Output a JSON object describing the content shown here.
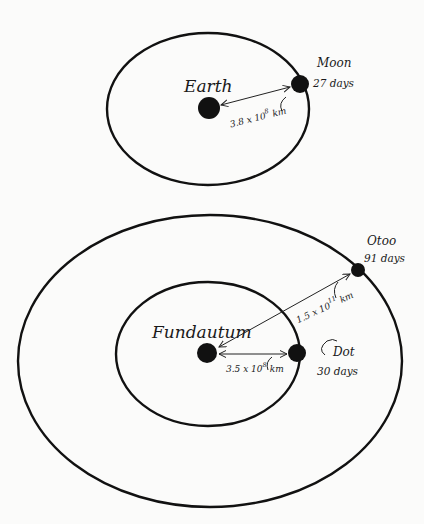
{
  "diagrams": [
    {
      "id": "earth-system",
      "central_body": {
        "name": "Earth"
      },
      "satellites": [
        {
          "name": "Moon",
          "period": "27 days",
          "distance": {
            "mantissa": "3.8 x 10",
            "exponent": "8",
            "unit": "km"
          }
        }
      ]
    },
    {
      "id": "fundautum-system",
      "central_body": {
        "name": "Fundautum"
      },
      "satellites": [
        {
          "name": "Dot",
          "period": "30 days",
          "distance": {
            "mantissa": "3.5 x 10",
            "exponent": "8",
            "unit": "km"
          }
        },
        {
          "name": "Otoo",
          "period": "91 days",
          "distance": {
            "mantissa": "1.5 x 10",
            "exponent": "11",
            "unit": "km"
          }
        }
      ]
    }
  ],
  "colors": {
    "ink": "#111111",
    "paper": "#fbfbfa"
  }
}
